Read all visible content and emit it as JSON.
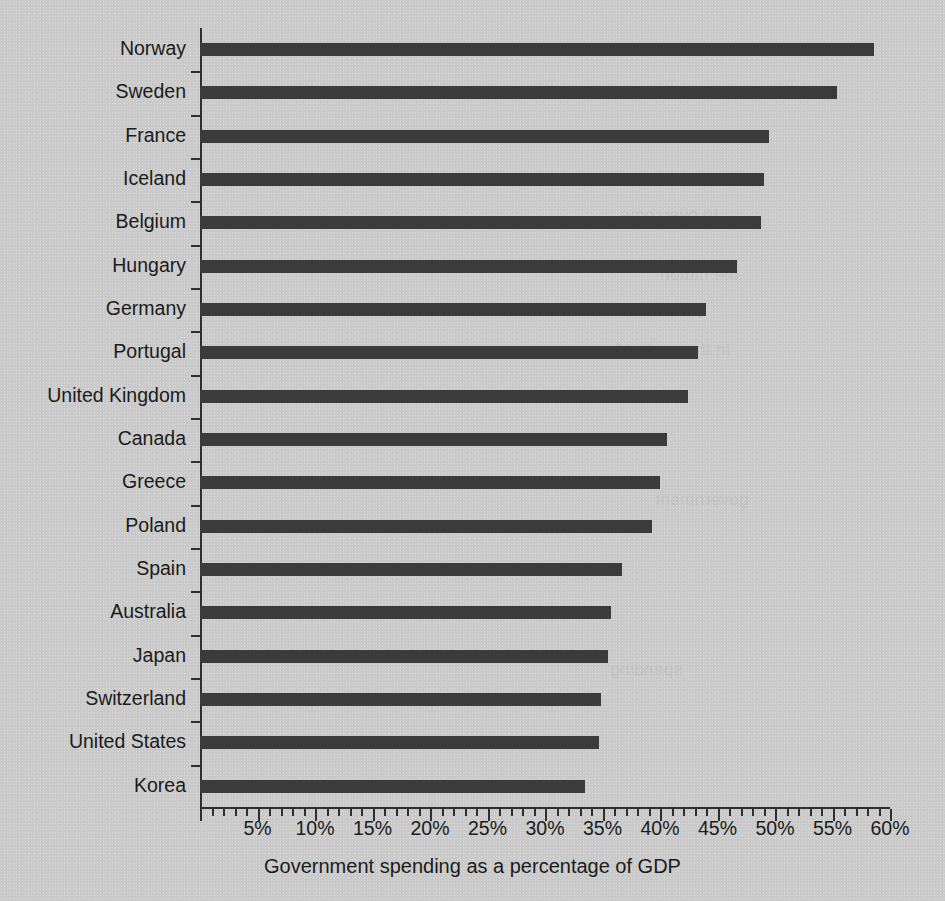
{
  "chart_data": {
    "type": "bar",
    "orientation": "horizontal",
    "title": "",
    "xlabel": "Government spending as a percentage of GDP",
    "ylabel": "",
    "xlim": [
      0,
      60
    ],
    "xtick_step": 5,
    "minor_tick_step": 1,
    "grid": false,
    "legend": false,
    "value_suffix": "%",
    "bar_color": "#3b3b3b",
    "background_color": "#c9c9c9",
    "axis_color": "#2f2f2f",
    "categories": [
      "Norway",
      "Sweden",
      "France",
      "Iceland",
      "Belgium",
      "Hungary",
      "Germany",
      "Portugal",
      "United Kingdom",
      "Canada",
      "Greece",
      "Poland",
      "Spain",
      "Australia",
      "Japan",
      "Switzerland",
      "United States",
      "Korea"
    ],
    "values": [
      58.6,
      55.4,
      49.5,
      49.0,
      48.8,
      46.7,
      44.0,
      43.3,
      42.4,
      40.6,
      40.0,
      39.3,
      36.7,
      35.7,
      35.5,
      34.9,
      34.7,
      33.5
    ],
    "xtick_labels": [
      "5%",
      "10%",
      "15%",
      "20%",
      "25%",
      "30%",
      "35%",
      "40%",
      "45%",
      "50%",
      "55%",
      "60%"
    ],
    "xtick_values": [
      5,
      10,
      15,
      20,
      25,
      30,
      35,
      40,
      45,
      50,
      55,
      60
    ]
  },
  "axis": {
    "x_title": "Government spending as a percentage of GDP"
  },
  "ghost_text": {
    "lines": [
      "to overcome",
      "the nation",
      "position",
      "in the market for",
      "government",
      "spending"
    ]
  }
}
